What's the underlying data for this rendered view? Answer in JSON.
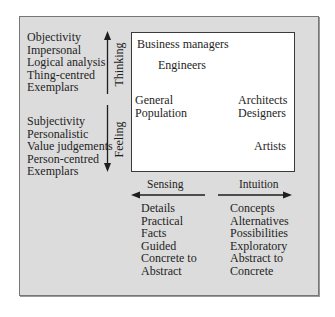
{
  "diagram": {
    "type": "personality-dimension-matrix",
    "axes": {
      "vertical": {
        "top_label": "Thinking",
        "bottom_label": "Feeling"
      },
      "horizontal": {
        "left_label": "Sensing",
        "right_label": "Intuition"
      }
    },
    "thinking_traits": [
      "Objectivity",
      "Impersonal",
      "Logical analysis",
      "Thing-centred",
      "Exemplars"
    ],
    "feeling_traits": [
      "Subjectivity",
      "Personalistic",
      "Value judgements",
      "Person-centred",
      "Exemplars"
    ],
    "sensing_traits": [
      "Details",
      "Practical",
      "Facts",
      "Guided",
      "Concrete to",
      "Abstract"
    ],
    "intuition_traits": [
      "Concepts",
      "Alternatives",
      "Possibilities",
      "Exploratory",
      "Abstract to",
      "Concrete"
    ],
    "quadrant_groups": {
      "business_managers": "Business managers",
      "engineers": "Engineers",
      "general_line1": "General",
      "general_line2": "Population",
      "architects": "Architects",
      "designers": "Designers",
      "artists": "Artists"
    },
    "colors": {
      "panel_fill": "#dcdcdc",
      "inner_fill": "#ffffff",
      "border": "#777777",
      "ink": "#1e1e1e"
    }
  }
}
